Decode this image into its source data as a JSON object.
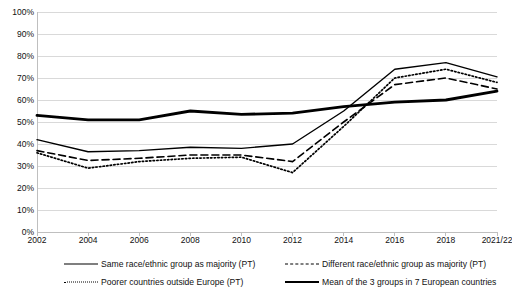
{
  "chart_data": {
    "type": "line",
    "title": "",
    "subtitle": "",
    "xlabel": "",
    "ylabel": "",
    "ylim": [
      0,
      100
    ],
    "ytick_values": [
      0,
      10,
      20,
      30,
      40,
      50,
      60,
      70,
      80,
      90,
      100
    ],
    "ytick_labels": [
      "0%",
      "10%",
      "20%",
      "30%",
      "40%",
      "50%",
      "60%",
      "70%",
      "80%",
      "90%",
      "100%"
    ],
    "grid": true,
    "grid_axis": "y",
    "legend_position": "bottom",
    "categories": [
      "2002",
      "2004",
      "2006",
      "2008",
      "2010",
      "2012",
      "2014",
      "2016",
      "2018",
      "2021/22"
    ],
    "series": [
      {
        "name": "Same race/ethnic group as majority (PT)",
        "style": "solid-thin",
        "values": [
          42,
          36.5,
          37,
          38.5,
          38,
          40,
          55,
          74,
          77,
          70.5
        ]
      },
      {
        "name": "Different race/ethnic group as majority (PT)",
        "style": "dashed",
        "values": [
          37,
          32.5,
          33.5,
          35,
          35,
          32,
          50,
          67,
          70,
          65
        ]
      },
      {
        "name": "Poorer countries outside Europe (PT)",
        "style": "dotted",
        "values": [
          36,
          29,
          32,
          33.5,
          34,
          27,
          48,
          70,
          74,
          68
        ]
      },
      {
        "name": "Mean of the 3 groups in 7 European countries",
        "style": "solid-thick",
        "values": [
          53,
          51,
          51,
          55,
          53.5,
          54,
          57,
          59,
          60,
          64
        ]
      }
    ]
  },
  "legend": {
    "items": [
      {
        "label": "Same race/ethnic group as majority (PT)",
        "key": "solid-thin-key"
      },
      {
        "label": "Different race/ethnic group as majority (PT)",
        "key": "dashed-key"
      },
      {
        "label": "Poorer countries outside Europe (PT)",
        "key": "dotted-key"
      },
      {
        "label": "Mean of the 3 groups in 7 European countries",
        "key": "solid-thick-key"
      }
    ]
  },
  "colors": {
    "line": "#000000",
    "grid": "#d9d9d9",
    "axis": "#bfbfbf",
    "text": "#111111",
    "background": "#ffffff"
  }
}
